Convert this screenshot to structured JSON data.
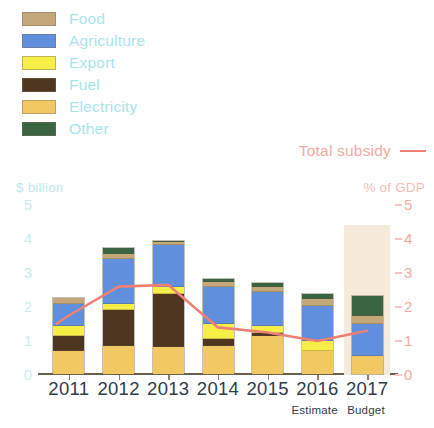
{
  "legend": {
    "items": [
      {
        "label": "Food",
        "color": "#c4a87a"
      },
      {
        "label": "Agriculture",
        "color": "#5f8fdd"
      },
      {
        "label": "Export",
        "color": "#f7ee48"
      },
      {
        "label": "Fuel",
        "color": "#4e3620"
      },
      {
        "label": "Electricity",
        "color": "#f2c863"
      },
      {
        "label": "Other",
        "color": "#3b6442"
      }
    ],
    "text_color": "#a8e4ea"
  },
  "total_key": {
    "label": "Total subsidy",
    "color": "#ef8076"
  },
  "axes": {
    "left_title": "$ billion",
    "right_title": "% of GDP",
    "left_ticks": [
      "5",
      "4",
      "3",
      "2",
      "1",
      "0"
    ],
    "right_ticks": [
      "5",
      "4",
      "3",
      "2",
      "1",
      "0"
    ],
    "left_color": "#c7ecf1",
    "right_color": "#f4a9a0"
  },
  "notes": {
    "estimate": "Estimate",
    "budget": "Budget"
  },
  "chart_data": {
    "type": "bar",
    "title": "",
    "subtitle": "",
    "xlabel": "",
    "ylabel": "$ billion",
    "y2label": "% of GDP",
    "ylim": [
      0,
      5
    ],
    "y2lim": [
      0,
      5
    ],
    "grid": false,
    "legend_position": "top-left",
    "stacked": true,
    "categories": [
      "2011",
      "2012",
      "2013",
      "2014",
      "2015",
      "2016",
      "2017"
    ],
    "series": [
      {
        "name": "Electricity",
        "color": "#f2c863",
        "values": [
          0.7,
          0.85,
          0.8,
          0.85,
          1.15,
          0.7,
          0.55
        ]
      },
      {
        "name": "Fuel",
        "color": "#4e3620",
        "values": [
          0.45,
          1.05,
          1.6,
          0.2,
          0.08,
          0.0,
          0.0
        ]
      },
      {
        "name": "Export",
        "color": "#f7ee48",
        "values": [
          0.3,
          0.18,
          0.2,
          0.45,
          0.2,
          0.3,
          0.0
        ]
      },
      {
        "name": "Agriculture",
        "color": "#5f8fdd",
        "values": [
          0.65,
          1.35,
          1.25,
          1.1,
          1.05,
          1.05,
          0.95
        ]
      },
      {
        "name": "Food",
        "color": "#c4a87a",
        "values": [
          0.2,
          0.15,
          0.08,
          0.15,
          0.15,
          0.2,
          0.25
        ]
      },
      {
        "name": "Other",
        "color": "#3b6442",
        "values": [
          0.0,
          0.18,
          0.05,
          0.1,
          0.1,
          0.15,
          0.6
        ]
      }
    ],
    "totals": [
      2.3,
      3.35,
      3.9,
      2.8,
      2.65,
      2.4,
      2.35
    ],
    "line": {
      "name": "Total subsidy",
      "color": "#ef8076",
      "axis": "right",
      "values": [
        1.75,
        2.6,
        2.65,
        1.4,
        1.25,
        1.0,
        1.3
      ]
    },
    "annotations": [
      {
        "text": "Estimate",
        "x": "2016"
      },
      {
        "text": "Budget",
        "x": "2017"
      }
    ],
    "forecast_region": {
      "from": "2017",
      "color": "#f6eadb"
    }
  }
}
